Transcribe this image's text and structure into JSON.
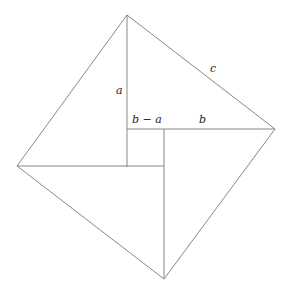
{
  "diagram": {
    "title": "",
    "labels": {
      "a": "a",
      "c": "c",
      "b_minus_a": "b − a",
      "b": "b"
    },
    "outer_square": {
      "top": [
        127,
        15
      ],
      "right": [
        275,
        129
      ],
      "bottom": [
        164,
        279
      ],
      "left": [
        17,
        166
      ]
    },
    "inner_square": {
      "top_left": [
        127,
        129
      ],
      "top_right": [
        164,
        129
      ],
      "bottom_right": [
        164,
        167
      ],
      "bottom_left": [
        127,
        167
      ]
    },
    "line_color": "#7a7a7a"
  }
}
